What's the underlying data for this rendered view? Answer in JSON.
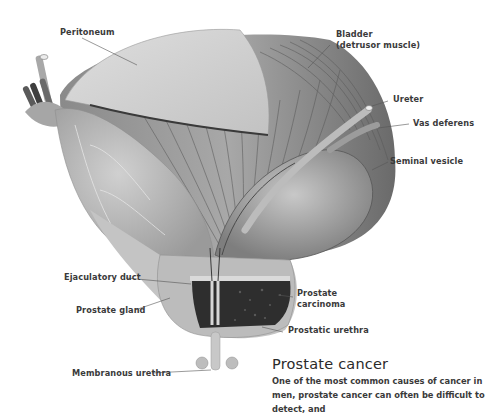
{
  "figure": {
    "labels": {
      "peritoneum": "Peritoneum",
      "bladder_line1": "Bladder",
      "bladder_line2": "(detrusor muscle)",
      "ureter": "Ureter",
      "vas_deferens": "Vas deferens",
      "seminal_vesicle": "Seminal vesicle",
      "ejaculatory_duct": "Ejaculatory duct",
      "prostate_gland": "Prostate gland",
      "prostate_carcinoma_line1": "Prostate",
      "prostate_carcinoma_line2": "carcinoma",
      "prostatic_urethra": "Prostatic urethra",
      "membranous_urethra": "Membranous urethra"
    }
  },
  "article": {
    "heading": "Prostate cancer",
    "body": "One of the most common causes of cancer in men, prostate cancer can often be difficult to detect, and"
  }
}
